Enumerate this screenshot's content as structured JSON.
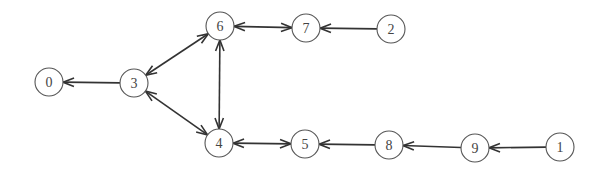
{
  "diagram": {
    "type": "directed-graph",
    "node_radius": 14,
    "colors": {
      "stroke": "#555555",
      "edge": "#333333",
      "label": "#444444",
      "background": "#ffffff"
    },
    "nodes": [
      {
        "id": "0",
        "label": "0",
        "x": 49,
        "y": 82
      },
      {
        "id": "3",
        "label": "3",
        "x": 134,
        "y": 83
      },
      {
        "id": "6",
        "label": "6",
        "x": 220,
        "y": 26
      },
      {
        "id": "7",
        "label": "7",
        "x": 306,
        "y": 28
      },
      {
        "id": "2",
        "label": "2",
        "x": 391,
        "y": 29
      },
      {
        "id": "4",
        "label": "4",
        "x": 219,
        "y": 143
      },
      {
        "id": "5",
        "label": "5",
        "x": 305,
        "y": 144
      },
      {
        "id": "8",
        "label": "8",
        "x": 389,
        "y": 145
      },
      {
        "id": "9",
        "label": "9",
        "x": 475,
        "y": 148
      },
      {
        "id": "1",
        "label": "1",
        "x": 560,
        "y": 147
      }
    ],
    "edges": [
      {
        "from": "3",
        "to": "0",
        "bidirectional": false
      },
      {
        "from": "3",
        "to": "6",
        "bidirectional": true
      },
      {
        "from": "3",
        "to": "4",
        "bidirectional": true
      },
      {
        "from": "6",
        "to": "4",
        "bidirectional": true
      },
      {
        "from": "6",
        "to": "7",
        "bidirectional": true
      },
      {
        "from": "2",
        "to": "7",
        "bidirectional": false
      },
      {
        "from": "4",
        "to": "5",
        "bidirectional": true
      },
      {
        "from": "8",
        "to": "5",
        "bidirectional": false
      },
      {
        "from": "9",
        "to": "8",
        "bidirectional": false
      },
      {
        "from": "1",
        "to": "9",
        "bidirectional": false
      }
    ]
  }
}
